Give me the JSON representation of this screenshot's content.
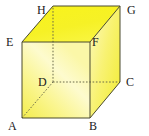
{
  "figure": {
    "name": "cube-diagram",
    "shape": "cube",
    "width": 149,
    "height": 136,
    "background_color": "#FFFFFF"
  },
  "colors": {
    "top_face": "#F7F21F",
    "top_face_edge": "#EDE61A",
    "front_face_light": "#FDFBC9",
    "front_face_mid": "#FAF58E",
    "front_face_dark": "#F5EF55",
    "right_face_light": "#FBF6A0",
    "right_face_dark": "#F3ED3E",
    "edge_stroke": "#4A4A2E",
    "hidden_edge_stroke": "#6B6B4A",
    "label_text": "#1A1A1A"
  },
  "vertices": [
    {
      "id": "A",
      "label": "A",
      "x": 22,
      "y": 118,
      "hidden": false,
      "label_x": 8,
      "label_y": 120
    },
    {
      "id": "B",
      "label": "B",
      "x": 90,
      "y": 118,
      "hidden": false,
      "label_x": 89,
      "label_y": 120
    },
    {
      "id": "C",
      "label": "C",
      "x": 120,
      "y": 82,
      "hidden": false,
      "label_x": 126,
      "label_y": 76
    },
    {
      "id": "D",
      "label": "D",
      "x": 53,
      "y": 82,
      "hidden": true,
      "label_x": 38,
      "label_y": 76
    },
    {
      "id": "E",
      "label": "E",
      "x": 22,
      "y": 42,
      "hidden": false,
      "label_x": 6,
      "label_y": 36
    },
    {
      "id": "F",
      "label": "F",
      "x": 90,
      "y": 42,
      "hidden": false,
      "label_x": 92,
      "label_y": 36
    },
    {
      "id": "G",
      "label": "G",
      "x": 120,
      "y": 6,
      "hidden": false,
      "label_x": 127,
      "label_y": 4
    },
    {
      "id": "H",
      "label": "H",
      "x": 53,
      "y": 6,
      "hidden": false,
      "label_x": 37,
      "label_y": 4
    }
  ],
  "faces": [
    {
      "name": "top-face",
      "vertices": "E,F,G,H",
      "visible": true,
      "fill": "#F7F21F"
    },
    {
      "name": "front-face",
      "vertices": "A,B,F,E",
      "visible": true,
      "fill": "gradient-front"
    },
    {
      "name": "right-face",
      "vertices": "B,C,G,F",
      "visible": true,
      "fill": "gradient-right"
    },
    {
      "name": "bottom-face",
      "vertices": "A,B,C,D",
      "visible": false,
      "fill": "none"
    },
    {
      "name": "left-face",
      "vertices": "A,D,H,E",
      "visible": false,
      "fill": "none"
    },
    {
      "name": "back-face",
      "vertices": "D,C,G,H",
      "visible": false,
      "fill": "none"
    }
  ],
  "edges": [
    {
      "name": "edge-AB",
      "from": "A",
      "to": "B",
      "hidden": false
    },
    {
      "name": "edge-BF",
      "from": "B",
      "to": "F",
      "hidden": false
    },
    {
      "name": "edge-FE",
      "from": "F",
      "to": "E",
      "hidden": false
    },
    {
      "name": "edge-EA",
      "from": "E",
      "to": "A",
      "hidden": false
    },
    {
      "name": "edge-BC",
      "from": "B",
      "to": "C",
      "hidden": false
    },
    {
      "name": "edge-CG",
      "from": "C",
      "to": "G",
      "hidden": false
    },
    {
      "name": "edge-GF",
      "from": "G",
      "to": "F",
      "hidden": false
    },
    {
      "name": "edge-GH",
      "from": "G",
      "to": "H",
      "hidden": false
    },
    {
      "name": "edge-HE",
      "from": "H",
      "to": "E",
      "hidden": false
    },
    {
      "name": "edge-AD",
      "from": "A",
      "to": "D",
      "hidden": true
    },
    {
      "name": "edge-DC",
      "from": "D",
      "to": "C",
      "hidden": true
    },
    {
      "name": "edge-DH",
      "from": "D",
      "to": "H",
      "hidden": true
    }
  ]
}
